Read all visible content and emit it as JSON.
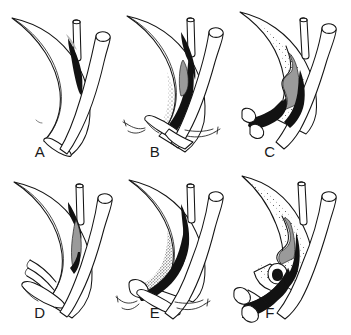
{
  "figure": {
    "kind": "medical-surgical-illustration",
    "background_color": "#ffffff",
    "ink_color": "#141414",
    "shading_colors": {
      "solid_black": "#121212",
      "mid_gray": "#9a9a9a",
      "soft_gray": "#b5b5b5",
      "stipple": "#2a2a2a"
    },
    "width": 351,
    "height": 335,
    "grid": {
      "columns": 3,
      "rows": 2
    },
    "panels": [
      {
        "id": "A",
        "label": "A",
        "label_x": 40,
        "label_y": 157,
        "column": 1,
        "row": 1,
        "features": [
          "crescent-vessel-wall",
          "vertical-narrow-tube",
          "diagonal-wide-tube",
          "black-wedge-shading",
          "inner-lumen-line"
        ]
      },
      {
        "id": "B",
        "label": "B",
        "label_x": 155,
        "label_y": 157,
        "column": 2,
        "row": 1,
        "features": [
          "crescent-vessel-wall",
          "vertical-narrow-tube",
          "diagonal-wide-tube",
          "black-wedge-shading",
          "stippled-band",
          "black-anastomosis-band",
          "suture-needle-left",
          "suture-needle-right",
          "open-tube-end"
        ]
      },
      {
        "id": "C",
        "label": "C",
        "label_x": 270,
        "label_y": 157,
        "column": 3,
        "row": 1,
        "features": [
          "stippled-crescent-vessel-wall",
          "notched-inner-contour",
          "vertical-narrow-tube",
          "diagonal-wide-tube",
          "heavy-black-band",
          "two-open-tube-ends"
        ]
      },
      {
        "id": "D",
        "label": "D",
        "label_x": 40,
        "label_y": 318,
        "column": 1,
        "row": 2,
        "features": [
          "crescent-vessel-wall",
          "vertical-narrow-tube",
          "diagonal-wide-tube",
          "black-wedge-shading",
          "gray-patch",
          "nested-flap-incision-lines",
          "open-tube-end"
        ]
      },
      {
        "id": "E",
        "label": "E",
        "label_x": 155,
        "label_y": 318,
        "column": 2,
        "row": 2,
        "features": [
          "crescent-vessel-wall",
          "vertical-narrow-tube",
          "diagonal-wide-tube",
          "stippled-band",
          "thick-black-diagonal-band",
          "suture-needle-left",
          "suture-needle-right",
          "open-tube-end"
        ]
      },
      {
        "id": "F",
        "label": "F",
        "label_x": 270,
        "label_y": 318,
        "column": 3,
        "row": 2,
        "features": [
          "scalloped-crescent-vessel-wall",
          "rolled-flap-spiral",
          "vertical-narrow-tube",
          "diagonal-wide-tube",
          "large-black-filled-region",
          "two-open-tube-ends",
          "stippled-shading"
        ]
      }
    ]
  }
}
